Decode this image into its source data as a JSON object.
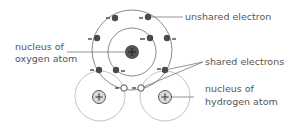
{
  "diagram": {
    "labels": {
      "unshared_electron": "unshared electron",
      "nucleus_oxygen_line1": "nucleus of",
      "nucleus_oxygen_line2": "oxygen atom",
      "shared_electrons": "shared electrons",
      "nucleus_hydrogen_line1": "nucleus of",
      "nucleus_hydrogen_line2": "hydrogen atom"
    },
    "symbols": {
      "plus": "+",
      "minus": "−"
    },
    "colors": {
      "electron": "#4a4a4a",
      "shared_electron_fill": "#ffffff",
      "oxygen_nucleus": "#555555",
      "hydrogen_nucleus": "#d8d8d8",
      "shell": "#888888",
      "hydrogen_shell": "#bbbbbb",
      "label_text": "#555555"
    }
  }
}
